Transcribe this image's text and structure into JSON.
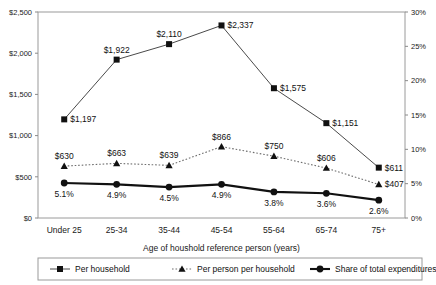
{
  "chart_data": {
    "type": "line",
    "title": "",
    "xlabel": "Age of houshold reference person (years)",
    "ylabel": "",
    "categories": [
      "Under 25",
      "25-34",
      "35-44",
      "45-54",
      "55-64",
      "65-74",
      "75+"
    ],
    "grid": false,
    "legend_position": "bottom",
    "axes": {
      "left": {
        "ylim": [
          0,
          2500
        ],
        "ticks": [
          0,
          500,
          1000,
          1500,
          2000,
          2500
        ],
        "tick_labels": [
          "$0",
          "$500",
          "$1,000",
          "$1,500",
          "$2,000",
          "$2,500"
        ]
      },
      "right": {
        "ylim": [
          0,
          30
        ],
        "ticks": [
          0,
          5,
          10,
          15,
          20,
          25,
          30
        ],
        "tick_labels": [
          "0%",
          "5%",
          "10%",
          "15%",
          "20%",
          "25%",
          "30%"
        ]
      }
    },
    "series": [
      {
        "name": "Per household",
        "axis": "left",
        "marker": "square",
        "line_style": "solid",
        "values": [
          1197,
          1922,
          2110,
          2337,
          1575,
          1151,
          611
        ],
        "data_labels": [
          "$1,197",
          "$1,922",
          "$2,110",
          "$2,337",
          "$1,575",
          "$1,151",
          "$611"
        ],
        "label_placement": [
          "right",
          "above",
          "above",
          "right",
          "right",
          "right",
          "right"
        ]
      },
      {
        "name": "Per person per household",
        "axis": "left",
        "marker": "triangle",
        "line_style": "dotted",
        "values": [
          630,
          663,
          639,
          866,
          750,
          606,
          407
        ],
        "data_labels": [
          "$630",
          "$663",
          "$639",
          "$866",
          "$750",
          "$606",
          "$407"
        ],
        "label_placement": [
          "above",
          "above",
          "above",
          "above",
          "above",
          "above",
          "right"
        ]
      },
      {
        "name": "Share of total expenditures",
        "axis": "right",
        "marker": "circle",
        "line_style": "solid-thick",
        "values": [
          5.1,
          4.9,
          4.5,
          4.9,
          3.8,
          3.6,
          2.6
        ],
        "data_labels": [
          "5.1%",
          "4.9%",
          "4.5%",
          "4.9%",
          "3.8%",
          "3.6%",
          "2.6%"
        ],
        "label_placement": [
          "below",
          "below",
          "below",
          "below",
          "below",
          "below",
          "below"
        ]
      }
    ]
  },
  "colors": {
    "series_per_household": "#4a4a4a",
    "series_per_person": "#6e6e6e",
    "series_share": "#111111",
    "plot_border": "#9a9a9a",
    "background": "#ffffff"
  }
}
